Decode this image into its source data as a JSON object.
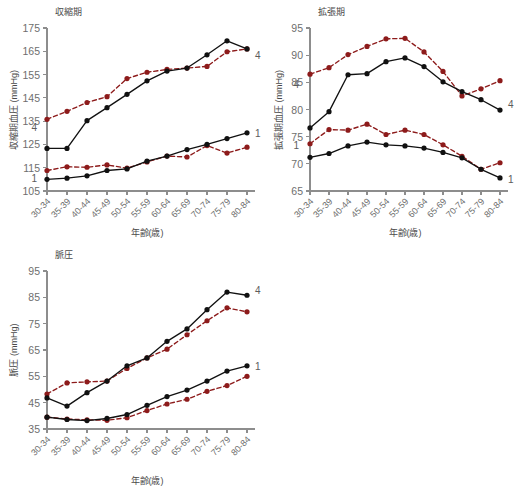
{
  "figure": {
    "axis_x_title": "年齢(歳)",
    "series_label_upper": "4",
    "series_label_lower": "1"
  },
  "chart_data": [
    {
      "id": "systolic",
      "type": "line",
      "title": "収縮期",
      "xlabel": "年齢(歳)",
      "ylabel": "収縮期血圧 (mmHg)",
      "ylim": [
        105,
        175
      ],
      "yticks": [
        105,
        115,
        125,
        135,
        145,
        155,
        165,
        175
      ],
      "grid": false,
      "legend_position": "line-end-labels",
      "categories": [
        "30-34",
        "35-39",
        "40-44",
        "45-49",
        "50-54",
        "55-59",
        "60-64",
        "65-69",
        "70-74",
        "75-79",
        "80-84"
      ],
      "series": [
        {
          "name": "4",
          "style": "dashed",
          "color": "#8d1b1b",
          "values": [
            135.8,
            139.2,
            143.0,
            145.5,
            153.3,
            156.0,
            157.2,
            157.8,
            158.5,
            164.8,
            166.0
          ]
        },
        {
          "name": "1",
          "style": "dashed",
          "color": "#8d1b1b",
          "values": [
            113.8,
            115.4,
            115.2,
            116.2,
            114.8,
            117.5,
            120.0,
            119.6,
            124.5,
            121.3,
            123.8
          ]
        },
        {
          "name": "4",
          "style": "solid",
          "color": "#111111",
          "values": [
            123.3,
            123.3,
            135.2,
            140.8,
            146.5,
            152.3,
            156.5,
            157.8,
            163.5,
            169.5,
            166.0
          ]
        },
        {
          "name": "1",
          "style": "solid",
          "color": "#111111",
          "values": [
            110.0,
            110.5,
            111.5,
            113.8,
            114.5,
            117.8,
            120.0,
            122.8,
            125.0,
            127.5,
            130.0
          ]
        }
      ]
    },
    {
      "id": "diastolic",
      "type": "line",
      "title": "拡張期",
      "xlabel": "年齢(歳)",
      "ylabel": "拡張期血圧 (mmHg)",
      "ylim": [
        65,
        95
      ],
      "yticks": [
        65,
        70,
        75,
        80,
        85,
        90,
        95
      ],
      "grid": false,
      "legend_position": "line-end-labels",
      "categories": [
        "30-34",
        "35-39",
        "40-44",
        "45-49",
        "50-54",
        "55-59",
        "60-64",
        "65-69",
        "70-74",
        "75-79",
        "80-84"
      ],
      "series": [
        {
          "name": "4",
          "style": "dashed",
          "color": "#8d1b1b",
          "values": [
            86.5,
            87.7,
            90.1,
            91.6,
            93.0,
            93.1,
            90.6,
            87.0,
            82.5,
            83.8,
            85.3
          ]
        },
        {
          "name": "1",
          "style": "dashed",
          "color": "#8d1b1b",
          "values": [
            73.7,
            76.3,
            76.2,
            77.3,
            75.4,
            76.2,
            75.4,
            73.5,
            71.4,
            69.0,
            70.2
          ]
        },
        {
          "name": "4",
          "style": "solid",
          "color": "#111111",
          "values": [
            76.6,
            79.6,
            86.4,
            86.6,
            88.8,
            89.5,
            87.9,
            85.1,
            83.3,
            81.8,
            79.9
          ]
        },
        {
          "name": "1",
          "style": "solid",
          "color": "#111111",
          "values": [
            71.2,
            71.9,
            73.3,
            74.0,
            73.5,
            73.3,
            72.9,
            72.1,
            71.1,
            69.0,
            67.4
          ]
        }
      ]
    },
    {
      "id": "pulse-pressure",
      "type": "line",
      "title": "脈圧",
      "xlabel": "年齢(歳)",
      "ylabel": "脈圧 (mmHg)",
      "ylim": [
        35,
        95
      ],
      "yticks": [
        35,
        45,
        55,
        65,
        75,
        85,
        95
      ],
      "grid": false,
      "legend_position": "line-end-labels",
      "categories": [
        "30-34",
        "35-39",
        "40-44",
        "45-49",
        "50-54",
        "55-59",
        "60-64",
        "65-69",
        "70-74",
        "75-79",
        "80-84"
      ],
      "series": [
        {
          "name": "4",
          "style": "dashed",
          "color": "#8d1b1b",
          "values": [
            48.3,
            52.5,
            52.9,
            53.2,
            58.0,
            62.0,
            65.3,
            70.8,
            76.1,
            81.0,
            79.5
          ]
        },
        {
          "name": "1",
          "style": "dashed",
          "color": "#8d1b1b",
          "values": [
            39.5,
            38.8,
            38.5,
            38.3,
            39.3,
            42.0,
            44.5,
            46.3,
            49.3,
            51.5,
            55.0
          ]
        },
        {
          "name": "4",
          "style": "solid",
          "color": "#111111",
          "values": [
            46.8,
            43.7,
            48.8,
            53.2,
            59.0,
            62.0,
            68.3,
            73.0,
            80.3,
            87.0,
            85.8
          ]
        },
        {
          "name": "1",
          "style": "solid",
          "color": "#111111",
          "values": [
            39.5,
            38.6,
            38.2,
            39.0,
            40.5,
            44.0,
            47.3,
            49.8,
            53.2,
            57.0,
            59.0
          ]
        }
      ]
    }
  ]
}
